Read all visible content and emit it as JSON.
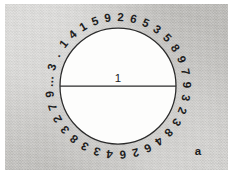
{
  "figure": {
    "label": "a",
    "background_color": "#cccbc8",
    "margin_color": "#ffffff",
    "ink_color": "#2b2b2b"
  },
  "circle": {
    "fill_color": "#fdfdfc",
    "stroke_color": "#2b2b2b",
    "center_x": 118,
    "center_y": 86,
    "radius": 58
  },
  "diameter": {
    "label": "1",
    "x1": 60,
    "y1": 86,
    "x2": 176,
    "y2": 86
  },
  "chart_data": {
    "type": "diagram",
    "title": "",
    "diameter_value": "1",
    "circumference_value": "3.141592653589793238462643383279...",
    "circumference_glyphs": [
      "3",
      ".",
      "1",
      "4",
      "1",
      "5",
      "9",
      "2",
      "6",
      "5",
      "3",
      "5",
      "8",
      "9",
      "7",
      "9",
      "3",
      "2",
      "3",
      "8",
      "4",
      "6",
      "2",
      "6",
      "4",
      "3",
      "3",
      "8",
      "3",
      "2",
      "7",
      "9",
      "…"
    ],
    "glyph_start_angle_deg": -74,
    "glyph_sweep_deg": 348,
    "glyph_radius": 68
  }
}
